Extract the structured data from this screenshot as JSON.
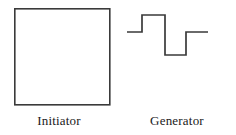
{
  "figure": {
    "background_color": "#ffffff",
    "stroke_color": "#3a3a3a",
    "text_color": "#1a1a1a",
    "width": 236,
    "height": 135
  },
  "panels": [
    {
      "name": "initiator",
      "caption": "Initiator",
      "shape": "square",
      "shape_description": "open square outline",
      "geometry": {
        "x": 14,
        "y": 8,
        "width": 96,
        "height": 97,
        "stroke_width": 1.6
      }
    },
    {
      "name": "generator",
      "caption": "Generator",
      "shape": "square-wave",
      "shape_description": "step waveform: flat baseline, step up, step down below baseline, step back to baseline",
      "geometry": {
        "stroke_width": 1.6,
        "x_start": 9,
        "x_end": 90,
        "level_high": 15,
        "level_mid": 32,
        "level_low": 55,
        "segments": [
          {
            "type": "horizontal",
            "level": "mid",
            "x1": 9,
            "x2": 24
          },
          {
            "type": "vertical",
            "x": 24,
            "from": "mid",
            "to": "high"
          },
          {
            "type": "horizontal",
            "level": "high",
            "x1": 24,
            "x2": 47
          },
          {
            "type": "vertical",
            "x": 47,
            "from": "high",
            "to": "low"
          },
          {
            "type": "horizontal",
            "level": "low",
            "x1": 47,
            "x2": 68
          },
          {
            "type": "vertical",
            "x": 68,
            "from": "low",
            "to": "mid"
          },
          {
            "type": "horizontal",
            "level": "mid",
            "x1": 68,
            "x2": 90
          }
        ]
      }
    }
  ]
}
